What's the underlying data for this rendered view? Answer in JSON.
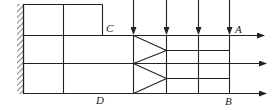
{
  "diagram": {
    "type": "structural-flow-schematic",
    "labels": {
      "A": "A",
      "B": "B",
      "C": "C",
      "D": "D"
    },
    "colors": {
      "line": "#222222",
      "background": "#ffffff"
    },
    "elements": {
      "fixed_wall": "hatched wall on left",
      "grid": "3x2 rectangular grid block",
      "downward_arrows": 4,
      "rightward_arrows": 3,
      "triangles": 2
    }
  }
}
